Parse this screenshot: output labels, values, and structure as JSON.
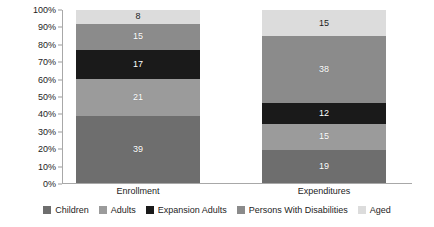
{
  "chart_data": {
    "type": "bar",
    "variant": "stacked-100-percent",
    "title": "",
    "xlabel": "",
    "ylabel": "",
    "ylim": [
      0,
      100
    ],
    "grid": false,
    "legend_position": "bottom",
    "categories": [
      "Enrollment",
      "Expenditures"
    ],
    "y_ticks": [
      "0%",
      "10%",
      "20%",
      "30%",
      "40%",
      "50%",
      "60%",
      "70%",
      "80%",
      "90%",
      "100%"
    ],
    "y_tick_values": [
      0,
      10,
      20,
      30,
      40,
      50,
      60,
      70,
      80,
      90,
      100
    ],
    "series": [
      {
        "name": "Children",
        "values": [
          39,
          19
        ],
        "color": "#6e6e6e",
        "label_color": "light"
      },
      {
        "name": "Adults",
        "values": [
          21,
          15
        ],
        "color": "#9b9b9b",
        "label_color": "light"
      },
      {
        "name": "Expansion Adults",
        "values": [
          17,
          12
        ],
        "color": "#1a1a1a",
        "label_color": "light"
      },
      {
        "name": "Persons With Disabilities",
        "values": [
          15,
          38
        ],
        "color": "#8b8b8b",
        "label_color": "light"
      },
      {
        "name": "Aged",
        "values": [
          8,
          15
        ],
        "color": "#dcdcdc",
        "label_color": "dark"
      }
    ]
  },
  "colors": {
    "background": "#ffffff",
    "axis": "#a8a8a8",
    "text": "#1d1d1d",
    "children": "#6e6e6e",
    "adults": "#9b9b9b",
    "expansion_adults": "#1a1a1a",
    "persons_with_disabilities": "#8b8b8b",
    "aged": "#dcdcdc"
  }
}
